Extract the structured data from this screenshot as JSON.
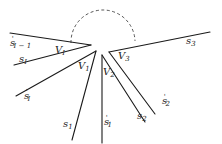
{
  "diagram": {
    "type": "geometric-wedge-diagram",
    "labels": {
      "s_prime_I_minus_1": {
        "base": "s",
        "prime": "'",
        "sub": "I − 1"
      },
      "s_I": {
        "base": "s",
        "sub": "I"
      },
      "s_prime_I": {
        "base": "s",
        "prime": "'",
        "sub": "I"
      },
      "s_1": {
        "base": "s",
        "sub": "1"
      },
      "s_prime_1": {
        "base": "s",
        "prime": "'",
        "sub": "1"
      },
      "s_2": {
        "base": "s",
        "sub": "2"
      },
      "s_prime_2": {
        "base": "s",
        "prime": "'",
        "sub": "2"
      },
      "s_3": {
        "base": "s",
        "sub": "3"
      },
      "V_I": {
        "base": "V",
        "sub": "I"
      },
      "V_1": {
        "base": "V",
        "sub": "1"
      },
      "V_2": {
        "base": "V",
        "sub": "2"
      },
      "V_3": {
        "base": "V",
        "sub": "3"
      }
    },
    "colors": {
      "line": "#1a1a1a",
      "dashed_arc": "#444444",
      "background": "#ffffff"
    }
  }
}
